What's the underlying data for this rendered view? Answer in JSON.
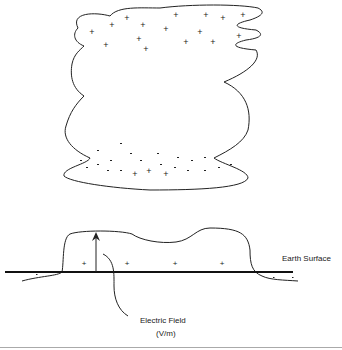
{
  "labels": {
    "earth_surface": "Earth Surface",
    "electric_field": "Electric Field",
    "electric_field_unit": "(V/m)"
  },
  "cloud": {
    "upper_charge": "+",
    "lower_charge": "-",
    "upper_plus_count": 15,
    "lower_minus_count": 22,
    "lower_plus_count": 3
  },
  "ground": {
    "induced_charge": "+",
    "outer_charge": "-"
  },
  "colors": {
    "stroke": "#222222",
    "separator": "#aaaaaa"
  }
}
